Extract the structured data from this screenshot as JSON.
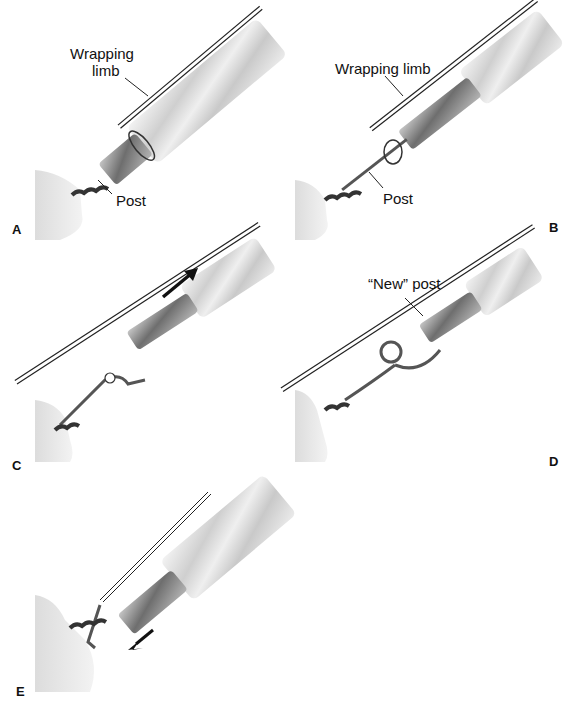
{
  "figure": {
    "panels": [
      {
        "id": "A",
        "letter": "A",
        "labels": [
          "Wrapping",
          "limb",
          "Post"
        ]
      },
      {
        "id": "B",
        "letter": "B",
        "labels": [
          "Wrapping limb",
          "Post"
        ]
      },
      {
        "id": "C",
        "letter": "C",
        "arrow": "up-right"
      },
      {
        "id": "D",
        "letter": "D",
        "labels": [
          "“New” post"
        ]
      },
      {
        "id": "E",
        "letter": "E",
        "arrow": "down-left"
      }
    ]
  },
  "colors": {
    "tissue": "#e8e8e8",
    "cannula": "#d8d8d8",
    "knot_pusher": "#8a8a8a",
    "post_suture": "#555555",
    "arrow": "#111111"
  }
}
